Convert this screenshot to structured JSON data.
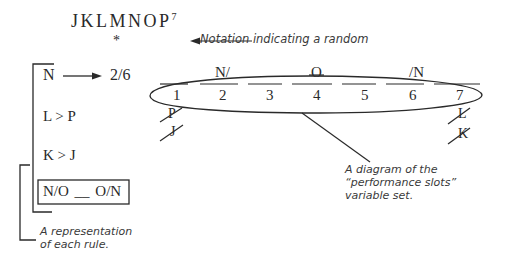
{
  "header": {
    "variables": "JKLMNOP",
    "count": "7",
    "random_marker": "*",
    "random_annotation": "Notation indicating a random"
  },
  "rules": {
    "items": [
      {
        "text": "N",
        "arrow_target": "2/6"
      },
      {
        "text": "L > P"
      },
      {
        "text": "K > J"
      },
      {
        "text": "N/O __ O/N"
      }
    ],
    "annotation_line1": "A representation",
    "annotation_line2": "of each rule."
  },
  "slots": {
    "numbers": [
      "1",
      "2",
      "3",
      "4",
      "5",
      "6",
      "7"
    ],
    "above": [
      {
        "slot": 2,
        "text": "N/"
      },
      {
        "slot": 4,
        "text": "O",
        "crossed": true
      },
      {
        "slot": 6,
        "text": "/N"
      }
    ],
    "below": [
      {
        "slot": 1,
        "text": "P",
        "crossed": true
      },
      {
        "slot": 1,
        "text": "J",
        "crossed": true
      },
      {
        "slot": 7,
        "text": "L",
        "crossed": true
      },
      {
        "slot": 7,
        "text": "K",
        "crossed": true
      }
    ],
    "annotation_line1": "A diagram of the",
    "annotation_line2": "“performance slots”",
    "annotation_line3": "variable set."
  },
  "colors": {
    "ink": "#2a2a2a",
    "background": "#ffffff"
  }
}
